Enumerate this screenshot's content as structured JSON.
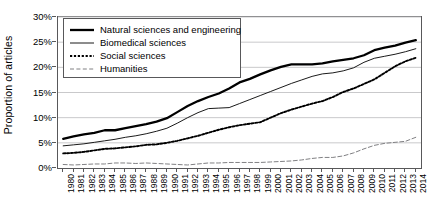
{
  "chart_data": {
    "type": "line",
    "title": "",
    "xlabel": "",
    "ylabel": "Proportion of articles",
    "ylim": [
      0,
      30
    ],
    "yticks": [
      "0%",
      "5%",
      "10%",
      "15%",
      "20%",
      "25%",
      "30%"
    ],
    "ytick_values": [
      0,
      5,
      10,
      15,
      20,
      25,
      30
    ],
    "grid": "horizontal",
    "legend_position": "top-left",
    "x": [
      1980,
      1981,
      1982,
      1983,
      1984,
      1985,
      1986,
      1987,
      1988,
      1989,
      1990,
      1991,
      1992,
      1993,
      1994,
      1995,
      1996,
      1997,
      1998,
      1999,
      2000,
      2001,
      2002,
      2003,
      2004,
      2005,
      2006,
      2007,
      2008,
      2009,
      2010,
      2011,
      2012,
      2013,
      2014
    ],
    "categories": [
      "1980",
      "1981",
      "1982",
      "1983",
      "1984",
      "1985",
      "1986",
      "1987",
      "1988",
      "1989",
      "1990",
      "1991",
      "1992",
      "1993",
      "1994",
      "1995",
      "1996",
      "1997",
      "1998",
      "1999",
      "2000",
      "2001",
      "2002",
      "2003",
      "2004",
      "2005",
      "2006",
      "2007",
      "2008",
      "2009",
      "2010",
      "2011",
      "2012",
      "2013",
      "2014"
    ],
    "series": [
      {
        "name": "Natural sciences and engineering",
        "style": "solid-thick",
        "color": "#000000",
        "values": [
          5.8,
          6.3,
          6.7,
          7.0,
          7.5,
          7.5,
          7.9,
          8.3,
          8.7,
          9.2,
          9.9,
          11.1,
          12.3,
          13.3,
          14.1,
          14.8,
          15.8,
          17.0,
          17.7,
          18.6,
          19.4,
          20.1,
          20.6,
          20.6,
          20.6,
          20.8,
          21.2,
          21.5,
          21.8,
          22.4,
          23.4,
          23.9,
          24.3,
          24.9,
          25.4
        ]
      },
      {
        "name": "Biomedical sciences",
        "style": "solid-thin",
        "color": "#000000",
        "values": [
          4.4,
          4.6,
          4.8,
          5.1,
          5.4,
          5.7,
          6.1,
          6.4,
          6.8,
          7.3,
          7.9,
          8.9,
          10.0,
          11.0,
          11.8,
          11.9,
          12.0,
          12.8,
          13.6,
          14.4,
          15.2,
          16.0,
          16.8,
          17.5,
          18.2,
          18.7,
          18.9,
          19.3,
          19.9,
          21.0,
          21.8,
          22.2,
          22.6,
          23.1,
          23.7
        ]
      },
      {
        "name": "Social sciences",
        "style": "dotted",
        "color": "#000000",
        "values": [
          2.9,
          3.0,
          3.2,
          3.5,
          3.8,
          3.9,
          4.1,
          4.3,
          4.6,
          4.7,
          5.0,
          5.4,
          5.9,
          6.4,
          7.0,
          7.6,
          8.1,
          8.5,
          8.8,
          9.1,
          10.0,
          10.9,
          11.6,
          12.2,
          12.8,
          13.3,
          14.1,
          15.1,
          15.8,
          16.7,
          17.6,
          18.9,
          20.2,
          21.2,
          21.9
        ]
      },
      {
        "name": "Humanities",
        "style": "dashed",
        "color": "#808083",
        "values": [
          0.7,
          0.6,
          0.7,
          0.8,
          0.8,
          1.0,
          1.0,
          0.9,
          1.0,
          0.9,
          0.8,
          0.7,
          0.6,
          0.8,
          1.0,
          1.0,
          1.1,
          1.1,
          1.1,
          1.1,
          1.2,
          1.3,
          1.4,
          1.6,
          1.9,
          2.1,
          2.1,
          2.4,
          3.0,
          3.8,
          4.5,
          4.9,
          5.1,
          5.3,
          6.1
        ]
      }
    ]
  }
}
